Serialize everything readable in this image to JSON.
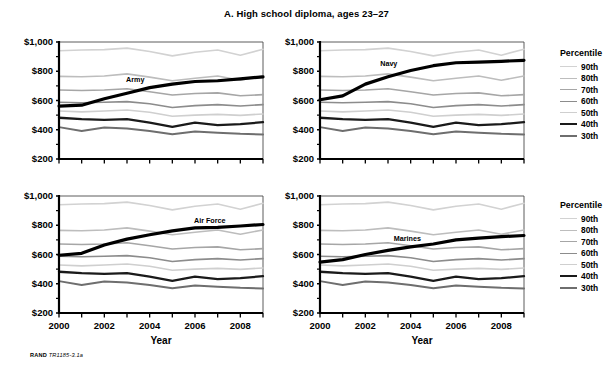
{
  "figure": {
    "title": "A. High school diploma, ages 23–27",
    "credit_prefix": "RAND",
    "credit_id": "TR1185-3.1a",
    "xlabel": "Year",
    "ylabel": ""
  },
  "legend": {
    "title": "Percentile",
    "entries": [
      {
        "label": "90th",
        "color": "#d2d2d2",
        "width": 1.6
      },
      {
        "label": "80th",
        "color": "#bdbdbd",
        "width": 1.6
      },
      {
        "label": "70th",
        "color": "#a6a6a6",
        "width": 1.6
      },
      {
        "label": "60th",
        "color": "#8c8c8c",
        "width": 1.6
      },
      {
        "label": "50th",
        "color": "#cfcfcf",
        "width": 1.6
      },
      {
        "label": "40th",
        "color": "#1a1a1a",
        "width": 2.3
      },
      {
        "label": "30th",
        "color": "#6e6e6e",
        "width": 2.0
      }
    ]
  },
  "axes": {
    "ylim": [
      200,
      1000
    ],
    "yticks": [
      200,
      400,
      600,
      800,
      1000
    ],
    "yticklabels": [
      "$200",
      "$400",
      "$600",
      "$800",
      "$1,000"
    ],
    "yminor": [
      300,
      500,
      700,
      900
    ],
    "xlim": [
      2000,
      2009
    ],
    "xticks": [
      2000,
      2001,
      2002,
      2003,
      2004,
      2005,
      2006,
      2007,
      2008,
      2009
    ],
    "xticklabels": [
      "2000",
      "",
      "2002",
      "",
      "2004",
      "",
      "2006",
      "",
      "2008",
      ""
    ],
    "grid": false
  },
  "chart_data": {
    "type": "line",
    "title": "A. High school diploma, ages 23–27",
    "xlabel": "Year",
    "ylabel": "",
    "ylim": [
      200,
      1000
    ],
    "xlim": [
      2000,
      2009
    ],
    "grid": false,
    "legend_position": "right",
    "legend_title": "Percentile",
    "x": [
      2000,
      2001,
      2002,
      2003,
      2004,
      2005,
      2006,
      2007,
      2008,
      2009
    ],
    "panels": [
      {
        "name": "Army",
        "label": "Army",
        "label_x": 2003.0,
        "label_y": 735,
        "series": [
          {
            "name": "90th",
            "values": [
              940,
              945,
              948,
              958,
              935,
              905,
              930,
              945,
              910,
              950
            ]
          },
          {
            "name": "80th",
            "values": [
              765,
              762,
              768,
              782,
              760,
              735,
              752,
              768,
              738,
              768
            ]
          },
          {
            "name": "70th",
            "values": [
              672,
              668,
              672,
              680,
              660,
              638,
              648,
              652,
              632,
              640
            ]
          },
          {
            "name": "60th",
            "values": [
              588,
              585,
              588,
              592,
              578,
              552,
              565,
              572,
              562,
              572
            ]
          },
          {
            "name": "50th",
            "values": [
              528,
              522,
              528,
              535,
              520,
              492,
              500,
              505,
              498,
              508
            ]
          },
          {
            "name": "40th",
            "values": [
              482,
              472,
              468,
              472,
              448,
              420,
              448,
              432,
              438,
              452
            ]
          },
          {
            "name": "30th",
            "values": [
              418,
              392,
              415,
              408,
              392,
              370,
              388,
              380,
              372,
              368
            ]
          },
          {
            "name": "Service",
            "values": [
              562,
              568,
              612,
              650,
              688,
              712,
              730,
              735,
              748,
              762
            ]
          }
        ]
      },
      {
        "name": "Navy",
        "label": "Navy",
        "label_x": 2002.7,
        "label_y": 840,
        "series": [
          {
            "name": "90th",
            "values": [
              940,
              945,
              948,
              958,
              935,
              905,
              930,
              945,
              910,
              950
            ]
          },
          {
            "name": "80th",
            "values": [
              765,
              762,
              768,
              782,
              760,
              735,
              752,
              768,
              738,
              768
            ]
          },
          {
            "name": "70th",
            "values": [
              672,
              668,
              672,
              680,
              660,
              638,
              648,
              652,
              632,
              640
            ]
          },
          {
            "name": "60th",
            "values": [
              588,
              585,
              588,
              592,
              578,
              552,
              565,
              572,
              562,
              572
            ]
          },
          {
            "name": "50th",
            "values": [
              528,
              522,
              528,
              535,
              520,
              492,
              500,
              505,
              498,
              508
            ]
          },
          {
            "name": "40th",
            "values": [
              482,
              472,
              468,
              472,
              448,
              420,
              448,
              432,
              438,
              452
            ]
          },
          {
            "name": "30th",
            "values": [
              418,
              392,
              415,
              408,
              392,
              370,
              388,
              380,
              372,
              368
            ]
          },
          {
            "name": "Service",
            "values": [
              605,
              632,
              712,
              762,
              805,
              838,
              858,
              862,
              868,
              875
            ]
          }
        ]
      },
      {
        "name": "Air Force",
        "label": "Air Force",
        "label_x": 2006.0,
        "label_y": 822,
        "series": [
          {
            "name": "90th",
            "values": [
              940,
              945,
              948,
              958,
              935,
              905,
              930,
              945,
              910,
              950
            ]
          },
          {
            "name": "80th",
            "values": [
              765,
              762,
              768,
              782,
              760,
              735,
              752,
              768,
              738,
              768
            ]
          },
          {
            "name": "70th",
            "values": [
              672,
              668,
              672,
              680,
              660,
              638,
              648,
              652,
              632,
              640
            ]
          },
          {
            "name": "60th",
            "values": [
              588,
              585,
              588,
              592,
              578,
              552,
              565,
              572,
              562,
              572
            ]
          },
          {
            "name": "50th",
            "values": [
              528,
              522,
              528,
              535,
              520,
              492,
              500,
              505,
              498,
              508
            ]
          },
          {
            "name": "40th",
            "values": [
              482,
              472,
              468,
              472,
              448,
              420,
              448,
              432,
              438,
              452
            ]
          },
          {
            "name": "30th",
            "values": [
              418,
              392,
              415,
              408,
              392,
              370,
              388,
              380,
              372,
              368
            ]
          },
          {
            "name": "Service",
            "values": [
              595,
              608,
              665,
              705,
              735,
              762,
              782,
              785,
              795,
              805
            ]
          }
        ]
      },
      {
        "name": "Marines",
        "label": "Marines",
        "label_x": 2003.3,
        "label_y": 700,
        "series": [
          {
            "name": "90th",
            "values": [
              940,
              945,
              948,
              958,
              935,
              905,
              930,
              945,
              910,
              950
            ]
          },
          {
            "name": "80th",
            "values": [
              765,
              762,
              768,
              782,
              760,
              735,
              752,
              768,
              738,
              768
            ]
          },
          {
            "name": "70th",
            "values": [
              672,
              668,
              672,
              680,
              660,
              638,
              648,
              652,
              632,
              640
            ]
          },
          {
            "name": "60th",
            "values": [
              588,
              585,
              588,
              592,
              578,
              552,
              565,
              572,
              562,
              572
            ]
          },
          {
            "name": "50th",
            "values": [
              528,
              522,
              528,
              535,
              520,
              492,
              500,
              505,
              498,
              508
            ]
          },
          {
            "name": "40th",
            "values": [
              482,
              472,
              468,
              472,
              448,
              420,
              448,
              432,
              438,
              452
            ]
          },
          {
            "name": "30th",
            "values": [
              418,
              392,
              415,
              408,
              392,
              370,
              388,
              380,
              372,
              368
            ]
          },
          {
            "name": "Service",
            "values": [
              548,
              565,
              600,
              628,
              652,
              672,
              700,
              712,
              722,
              730
            ]
          }
        ]
      }
    ],
    "series_style": {
      "90th": {
        "color": "#d2d2d2",
        "width": 1.6
      },
      "80th": {
        "color": "#bdbdbd",
        "width": 1.6
      },
      "70th": {
        "color": "#a6a6a6",
        "width": 1.6
      },
      "60th": {
        "color": "#8c8c8c",
        "width": 1.6
      },
      "50th": {
        "color": "#cfcfcf",
        "width": 1.6
      },
      "40th": {
        "color": "#1a1a1a",
        "width": 2.3
      },
      "30th": {
        "color": "#6e6e6e",
        "width": 2.0
      },
      "Service": {
        "color": "#000000",
        "width": 3.2
      }
    }
  }
}
